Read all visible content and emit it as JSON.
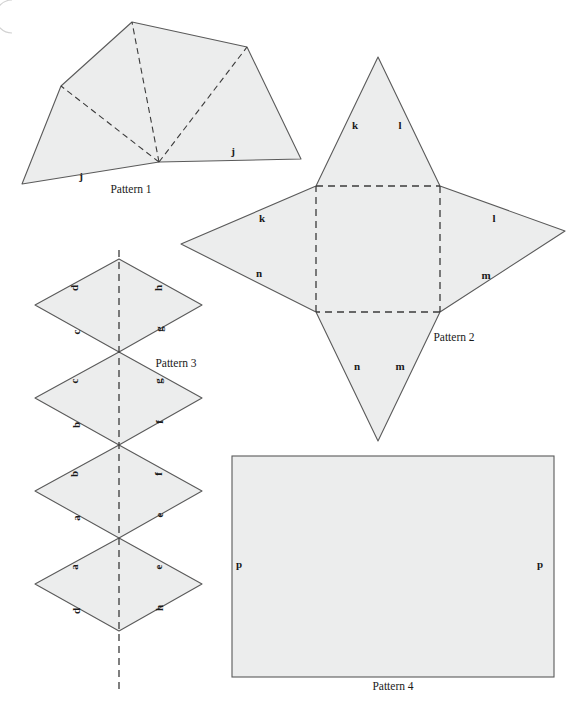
{
  "figure": {
    "background_color": "#ffffff",
    "face_fill": "#eceded",
    "edge_color": "#5a5a5a",
    "fold_color": "#3b3b3b",
    "label_color": "#1a1a1a",
    "corner_mark": "page-corner-arc"
  },
  "patterns": [
    {
      "id": "pattern-1",
      "caption": "Pattern 1",
      "caption_pos": {
        "x": 131,
        "y": 193
      },
      "shape": "pentagon-with-fold-lines",
      "outline": "22,184 61,86 132,22 247,47 301,159 159,162",
      "fold_lines": [
        "159,162 61,86",
        "159,162 132,22",
        "159,162 247,47"
      ],
      "labels": [
        {
          "text": "j",
          "x": 81,
          "y": 180
        },
        {
          "text": "j",
          "x": 233,
          "y": 155
        }
      ]
    },
    {
      "id": "pattern-2",
      "caption": "Pattern 2",
      "caption_pos": {
        "x": 454,
        "y": 341
      },
      "shape": "four-point-star-net",
      "outline": "316,186 378,57 440,186 565,231 440,312 378,441 316,312 181,244",
      "fold_lines": [
        "316,186 440,186",
        "440,186 440,312",
        "440,312 316,312",
        "316,312 316,186"
      ],
      "labels": [
        {
          "text": "k",
          "x": 355,
          "y": 129
        },
        {
          "text": "l",
          "x": 400,
          "y": 129
        },
        {
          "text": "k",
          "x": 262,
          "y": 222
        },
        {
          "text": "l",
          "x": 494,
          "y": 222
        },
        {
          "text": "n",
          "x": 259,
          "y": 277
        },
        {
          "text": "m",
          "x": 486,
          "y": 279
        },
        {
          "text": "n",
          "x": 357,
          "y": 370
        },
        {
          "text": "m",
          "x": 400,
          "y": 370
        }
      ]
    },
    {
      "id": "pattern-3",
      "caption": "Pattern 3",
      "caption_pos": {
        "x": 176,
        "y": 367
      },
      "shape": "four-stacked-rhombi-with-vertical-fold",
      "rhombi": [
        {
          "index": 1,
          "points": "119,259 202,305 119,352 35,305",
          "labels": [
            {
              "text": "d",
              "x": 78,
              "y": 288,
              "rotate": -90
            },
            {
              "text": "h",
              "x": 162,
              "y": 288,
              "rotate": -90
            },
            {
              "text": "c",
              "x": 80,
              "y": 332,
              "rotate": -90
            },
            {
              "text": "g",
              "x": 163,
              "y": 329,
              "rotate": -90
            }
          ]
        },
        {
          "index": 2,
          "points": "119,352 202,398 119,445 35,398",
          "labels": [
            {
              "text": "c",
              "x": 78,
              "y": 381,
              "rotate": -90
            },
            {
              "text": "g",
              "x": 162,
              "y": 381,
              "rotate": -90
            },
            {
              "text": "b",
              "x": 80,
              "y": 425,
              "rotate": -90
            },
            {
              "text": "f",
              "x": 163,
              "y": 422,
              "rotate": -90
            }
          ]
        },
        {
          "index": 3,
          "points": "119,445 202,491 119,538 35,491",
          "labels": [
            {
              "text": "b",
              "x": 78,
              "y": 474,
              "rotate": -90
            },
            {
              "text": "f",
              "x": 162,
              "y": 474,
              "rotate": -90
            },
            {
              "text": "a",
              "x": 80,
              "y": 518,
              "rotate": -90
            },
            {
              "text": "e",
              "x": 163,
              "y": 515,
              "rotate": -90
            }
          ]
        },
        {
          "index": 4,
          "points": "119,538 202,584 119,631 35,584",
          "labels": [
            {
              "text": "a",
              "x": 78,
              "y": 567,
              "rotate": -90
            },
            {
              "text": "e",
              "x": 162,
              "y": 567,
              "rotate": -90
            },
            {
              "text": "d",
              "x": 80,
              "y": 611,
              "rotate": -90
            },
            {
              "text": "h",
              "x": 163,
              "y": 608,
              "rotate": -90
            }
          ]
        }
      ],
      "fold_line": "119,259 119,692",
      "bottom_point": "119,692"
    },
    {
      "id": "pattern-4",
      "caption": "Pattern 4",
      "caption_pos": {
        "x": 393,
        "y": 690
      },
      "shape": "rectangle",
      "rect": {
        "x": 232,
        "y": 456,
        "width": 322,
        "height": 221
      },
      "labels": [
        {
          "text": "p",
          "x": 239,
          "y": 568
        },
        {
          "text": "p",
          "x": 540,
          "y": 568
        }
      ]
    }
  ]
}
